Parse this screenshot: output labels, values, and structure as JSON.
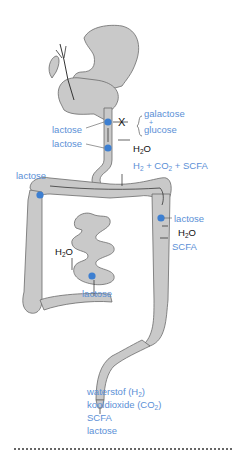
{
  "colors": {
    "organ_fill": "#c9c9c9",
    "organ_stroke": "#6b6b6b",
    "label_blue": "#5b8fd6",
    "marker_blue": "#3d7fd1",
    "label_black": "#111111"
  },
  "labels": {
    "small_intestine_block": {
      "lactose_1": "lactose",
      "lactose_2": "lactose",
      "blocked_symbol": "X",
      "products_top": "galactose",
      "plus": "+",
      "products_bottom": "glucose",
      "water": "H2O"
    },
    "fermentation_products": "H2 + CO2 + SCFA",
    "colon_left": {
      "lactose": "lactose"
    },
    "colon_right": {
      "lactose": "lactose",
      "water": "H2O",
      "scfa": "SCFA"
    },
    "ileum": {
      "water": "H2O",
      "lactose": "lactose"
    },
    "excretion": {
      "line1": "waterstof (H2)",
      "line2": "kooldioxide (CO2)",
      "line3": "SCFA",
      "line4": "lactose"
    }
  }
}
